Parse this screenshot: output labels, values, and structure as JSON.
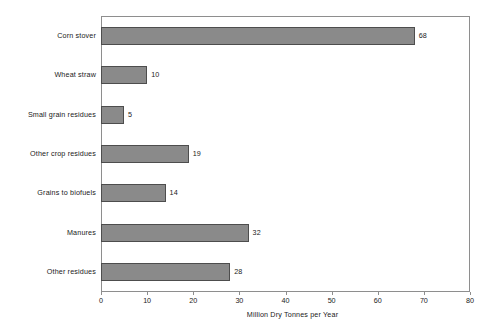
{
  "chart_data": {
    "type": "bar",
    "orientation": "horizontal",
    "title": "",
    "xlabel": "Million Dry Tonnes per Year",
    "ylabel": "",
    "xlim": [
      0,
      80
    ],
    "xticks": [
      0,
      10,
      20,
      30,
      40,
      50,
      60,
      70,
      80
    ],
    "grid": false,
    "legend": null,
    "categories": [
      "Corn stover",
      "Wheat straw",
      "Small grain residues",
      "Other crop residues",
      "Grains to biofuels",
      "Manures",
      "Other residues"
    ],
    "values": [
      68,
      10,
      5,
      19,
      14,
      32,
      28
    ],
    "data_labels": [
      "68",
      "10",
      "5",
      "19",
      "14",
      "32",
      "28"
    ],
    "colors": {
      "bar_fill": "#8a8a8a",
      "bar_edge": "#4d4d4d",
      "frame": "#8e8e8e",
      "text": "#1a1a1a",
      "background": "#ffffff"
    }
  }
}
